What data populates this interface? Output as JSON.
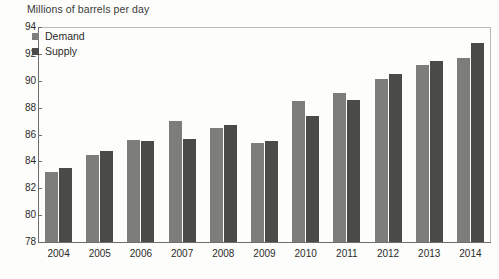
{
  "chart_data": {
    "type": "bar",
    "title": "Millions of barrels per day",
    "xlabel": "",
    "ylabel": "",
    "ylim": [
      78,
      94
    ],
    "ytick_step": 2,
    "yticks": [
      "78",
      "80",
      "82",
      "84",
      "86",
      "88",
      "90",
      "92",
      "94"
    ],
    "grid": false,
    "legend_position": "top-left",
    "categories": [
      "2004",
      "2005",
      "2006",
      "2007",
      "2008",
      "2009",
      "2010",
      "2011",
      "2012",
      "2013",
      "2014"
    ],
    "series": [
      {
        "name": "Demand",
        "color": "#7d7d7b",
        "values": [
          83.2,
          84.5,
          85.6,
          87.0,
          86.5,
          85.4,
          88.5,
          89.1,
          90.1,
          91.2,
          91.7
        ]
      },
      {
        "name": "Supply",
        "color": "#4a4a48",
        "values": [
          83.5,
          84.8,
          85.5,
          85.7,
          86.7,
          85.5,
          87.4,
          88.6,
          90.5,
          91.5,
          92.8
        ]
      }
    ]
  },
  "legend": {
    "items": [
      {
        "label": "Demand",
        "color": "#7d7d7b"
      },
      {
        "label": "Supply",
        "color": "#4a4a48"
      }
    ]
  }
}
